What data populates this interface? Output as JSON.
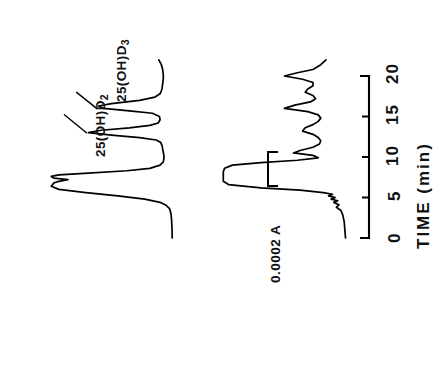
{
  "figure": {
    "type": "chromatogram",
    "orientation": "rotated-90-ccw",
    "background_color": "#ffffff",
    "trace_color": "#000000"
  },
  "axis": {
    "title": "TIME  (min)",
    "tick_labels": [
      "0",
      "5",
      "10",
      "15",
      "20"
    ]
  },
  "scale_bar": {
    "label": "0.0002 A"
  },
  "annotations": {
    "peak_d2_main": "25(OH)D",
    "peak_d2_sub": "2",
    "peak_d3_main": "25(OH)D",
    "peak_d3_sub": "3"
  },
  "chart_data": {
    "type": "line",
    "title": "",
    "subtitle": "",
    "xlabel": "TIME  (min)",
    "ylabel": "Absorbance",
    "xlim": [
      0,
      22
    ],
    "ylim": [
      0,
      1
    ],
    "grid": false,
    "legend": null,
    "xticks": [
      0,
      5,
      10,
      15,
      20
    ],
    "xtick_labels": [
      "0",
      "5",
      "10",
      "15",
      "20"
    ],
    "scale_bar_value": "0.0002 A",
    "annotations": [
      {
        "text": "25(OH)D2",
        "trace": "upper",
        "x": 13.0,
        "note": "labeled peak on upper trace"
      },
      {
        "text": "25(OH)D3",
        "trace": "upper",
        "x": 16.0,
        "note": "labeled peak on upper trace"
      }
    ],
    "series": [
      {
        "name": "upper",
        "x": [
          0.0,
          1.2,
          2.2,
          3.0,
          3.6,
          4.0,
          4.4,
          4.8,
          5.2,
          5.6,
          6.0,
          6.4,
          6.8,
          7.0,
          7.2,
          7.4,
          7.6,
          7.8,
          8.0,
          8.3,
          8.6,
          9.0,
          9.4,
          9.8,
          10.2,
          10.6,
          11.0,
          11.4,
          11.8,
          12.1,
          12.4,
          12.7,
          13.0,
          13.3,
          13.6,
          13.9,
          14.2,
          14.6,
          15.0,
          15.4,
          15.7,
          16.0,
          16.3,
          16.6,
          17.0,
          17.4,
          17.8,
          18.4,
          19.0,
          19.6,
          20.2,
          20.8,
          21.4,
          22.0
        ],
        "y": [
          0.045,
          0.047,
          0.05,
          0.055,
          0.065,
          0.09,
          0.14,
          0.26,
          0.47,
          0.72,
          0.93,
          0.99,
          0.97,
          0.93,
          0.86,
          0.97,
          0.99,
          0.93,
          0.7,
          0.4,
          0.22,
          0.14,
          0.115,
          0.11,
          0.11,
          0.115,
          0.12,
          0.125,
          0.135,
          0.17,
          0.3,
          0.52,
          0.7,
          0.6,
          0.38,
          0.22,
          0.155,
          0.14,
          0.145,
          0.2,
          0.38,
          0.58,
          0.62,
          0.52,
          0.3,
          0.18,
          0.14,
          0.125,
          0.12,
          0.115,
          0.115,
          0.12,
          0.13,
          0.15
        ]
      },
      {
        "name": "lower",
        "x": [
          0.0,
          1.0,
          2.0,
          2.8,
          3.4,
          3.8,
          4.1,
          4.4,
          4.6,
          4.8,
          5.0,
          5.2,
          5.4,
          5.6,
          5.9,
          6.2,
          6.6,
          7.0,
          7.4,
          7.8,
          8.2,
          8.6,
          9.0,
          9.3,
          9.6,
          9.9,
          10.2,
          10.5,
          10.8,
          11.2,
          11.6,
          12.0,
          12.4,
          12.8,
          13.2,
          13.6,
          14.0,
          14.4,
          14.8,
          15.2,
          15.6,
          16.0,
          16.4,
          16.8,
          17.2,
          17.6,
          18.0,
          18.4,
          18.8,
          19.2,
          19.6,
          20.0,
          20.4,
          20.8,
          21.4,
          22.0
        ],
        "y": [
          0.05,
          0.055,
          0.06,
          0.07,
          0.085,
          0.12,
          0.1,
          0.14,
          0.11,
          0.16,
          0.13,
          0.18,
          0.15,
          0.22,
          0.4,
          0.7,
          0.95,
          0.99,
          0.99,
          0.99,
          0.99,
          0.98,
          0.92,
          0.7,
          0.42,
          0.26,
          0.3,
          0.45,
          0.4,
          0.3,
          0.25,
          0.24,
          0.26,
          0.3,
          0.38,
          0.36,
          0.3,
          0.26,
          0.24,
          0.26,
          0.34,
          0.52,
          0.44,
          0.32,
          0.28,
          0.3,
          0.36,
          0.34,
          0.3,
          0.3,
          0.38,
          0.52,
          0.42,
          0.3,
          0.24,
          0.2
        ]
      }
    ]
  }
}
